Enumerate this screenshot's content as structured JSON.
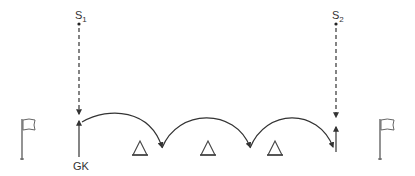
{
  "diagram": {
    "type": "drill-diagram",
    "colors": {
      "line": "#333333",
      "flag": "#666666",
      "background": "#ffffff"
    },
    "players": [
      {
        "id": "s1",
        "label": "S",
        "subscript": "1",
        "x": 79,
        "y": 24
      },
      {
        "id": "s2",
        "label": "S",
        "subscript": "2",
        "x": 336,
        "y": 24
      },
      {
        "id": "gk",
        "label": "GK",
        "x": 79,
        "y": 165
      }
    ],
    "cones": [
      {
        "x": 140
      },
      {
        "x": 208
      },
      {
        "x": 275
      }
    ],
    "flags": [
      {
        "id": "left-flag",
        "x": 22
      },
      {
        "id": "right-flag",
        "x": 380
      }
    ],
    "movements": [
      {
        "type": "dashed-run",
        "from": "s1",
        "to_y": 114
      },
      {
        "type": "dashed-run",
        "from": "s2",
        "to_y": 117
      },
      {
        "type": "solid-run",
        "from": "gk",
        "to_y": 121
      },
      {
        "type": "arc-jump",
        "count": 3
      }
    ]
  }
}
